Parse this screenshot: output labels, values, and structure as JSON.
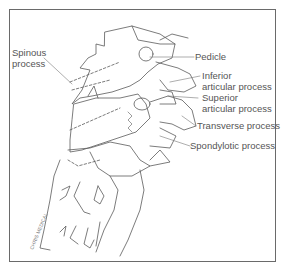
{
  "figure": {
    "type": "anatomical line illustration",
    "colors": {
      "line": "#5a5a5a",
      "frame": "#6a6a6a",
      "label_text": "#555555",
      "background": "#ffffff"
    }
  },
  "labels": {
    "spinous": {
      "line1": "Spinous",
      "line2": "process"
    },
    "pedicle": {
      "line1": "Pedicle"
    },
    "inferior_articular": {
      "line1": "Inferior",
      "line2": "articular process"
    },
    "superior_articular": {
      "line1": "Superior",
      "line2": "articular process"
    },
    "transverse": {
      "line1": "Transverse process"
    },
    "spondylotic": {
      "line1": "Spondylotic process"
    }
  },
  "signature": {
    "text": "CHRIS MEDICAL"
  }
}
